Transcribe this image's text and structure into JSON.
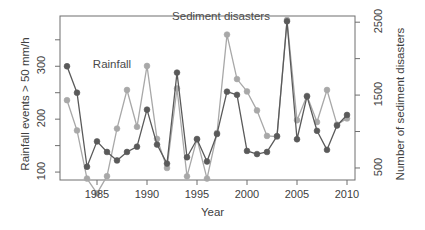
{
  "chart_data": {
    "type": "line",
    "title": "",
    "xlabel": "Year",
    "ylabel": "Rainfall events > 50 mm/h",
    "ylabel_right": "Number of sediment disasters",
    "xlim": [
      1981.3,
      2010.8
    ],
    "ylim": [
      85,
      395
    ],
    "ylim_right": [
      335,
      2585
    ],
    "grid": false,
    "legend_position": "inline-annotations",
    "xticks": [
      1985,
      1990,
      1995,
      2000,
      2005,
      2010
    ],
    "yticks_left": [
      100,
      200,
      300
    ],
    "yticks_left_minor": [
      150,
      250,
      350
    ],
    "yticks_right": [
      500,
      1500,
      2500
    ],
    "yticks_right_minor": [
      1000,
      2000
    ],
    "x": [
      1982,
      1983,
      1984,
      1985,
      1986,
      1987,
      1988,
      1989,
      1990,
      1991,
      1992,
      1993,
      1994,
      1995,
      1996,
      1997,
      1998,
      1999,
      2000,
      2001,
      2002,
      2003,
      2004,
      2005,
      2006,
      2007,
      2008,
      2009,
      2010
    ],
    "series": [
      {
        "name": "Rainfall",
        "axis": "left",
        "color": "#5a5a5a",
        "units": "events > 50 mm/h",
        "values": [
          300,
          250,
          110,
          158,
          138,
          122,
          138,
          148,
          218,
          152,
          116,
          288,
          128,
          162,
          120,
          172,
          252,
          246,
          140,
          134,
          138,
          168,
          385,
          162,
          243,
          178,
          142,
          188,
          208
        ]
      },
      {
        "name": "Sediment disasters",
        "axis": "right",
        "color": "#a8a8a8",
        "units": "number of disasters",
        "values": [
          1430,
          1015,
          355,
          152,
          388,
          1040,
          1570,
          1065,
          1900,
          900,
          500,
          1590,
          385,
          900,
          355,
          980,
          2330,
          1720,
          1550,
          1290,
          940,
          930,
          2530,
          1155,
          1490,
          1130,
          1570,
          1095,
          1180
        ]
      }
    ],
    "annotations": [
      {
        "text": "Rainfall",
        "x": 1986.5,
        "y": 300
      },
      {
        "text": "Sediment disasters",
        "x": 1997.4,
        "y": 392
      }
    ]
  },
  "axes": {
    "left_title": "Rainfall events > 50 mm/h",
    "right_title": "Number of sediment disasters",
    "x_title": "Year",
    "left_tick_labels": [
      "100",
      "200",
      "300"
    ],
    "right_tick_labels": [
      "500",
      "1500",
      "2500"
    ],
    "x_tick_labels": [
      "1985",
      "1990",
      "1995",
      "2000",
      "2005",
      "2010"
    ]
  },
  "labels": {
    "rainfall": "Rainfall",
    "sediment": "Sediment disasters"
  },
  "colors": {
    "rainfall": "#5a5a5a",
    "sediment": "#a8a8a8",
    "axis": "#4d4d4d",
    "background": "#ffffff"
  }
}
